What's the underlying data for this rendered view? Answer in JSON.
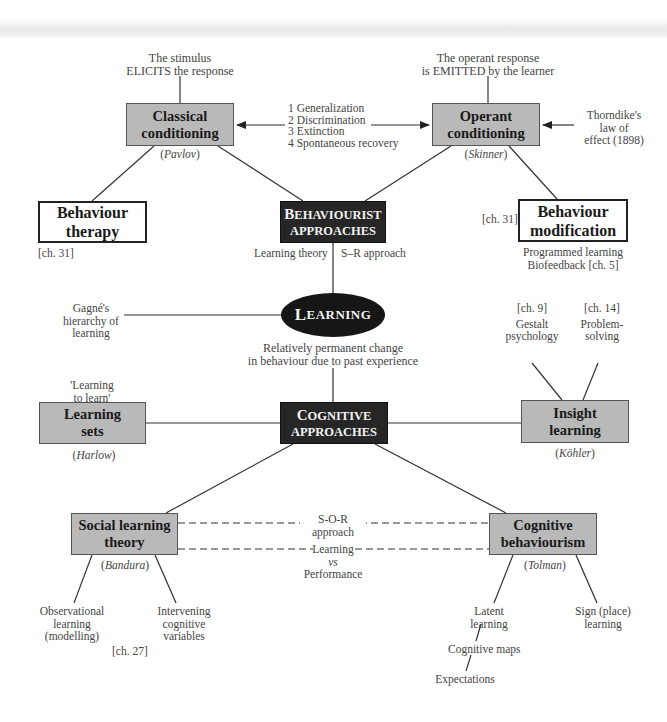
{
  "diagram": {
    "central_node": {
      "label_first": "L",
      "label_rest": "EARNING",
      "full_label": "LEARNING",
      "definition": [
        "Relatively permanent change",
        "in behaviour due to past experience"
      ]
    },
    "behaviourist": {
      "node": {
        "line1_first": "B",
        "line1_rest": "EHAVIOURIST",
        "line2": "APPROACHES"
      },
      "labels": {
        "left": "Learning theory",
        "right": "S–R approach"
      },
      "classical": {
        "title": [
          "Classical",
          "conditioning"
        ],
        "person": "Pavlov",
        "note": [
          "The stimulus",
          "ELICITS the response"
        ]
      },
      "operant": {
        "title": [
          "Operant",
          "conditioning"
        ],
        "person": "Skinner",
        "note": [
          "The operant response",
          "is EMITTED by the learner"
        ],
        "side_note": [
          "Thorndike's",
          "law of",
          "effect (1898)"
        ]
      },
      "shared_processes": [
        "1  Generalization",
        "2  Discrimination",
        "3  Extinction",
        "4  Spontaneous recovery"
      ],
      "behaviour_therapy": {
        "title": [
          "Behaviour",
          "therapy"
        ],
        "ref": "[ch. 31]"
      },
      "behaviour_modification": {
        "title": [
          "Behaviour",
          "modification"
        ],
        "ref": "[ch. 31]",
        "notes": [
          "Programmed learning",
          "Biofeedback [ch. 5]"
        ]
      }
    },
    "gagne": [
      "Gagné's",
      "hierarchy of",
      "learning"
    ],
    "cognitive": {
      "node": {
        "line1_first": "C",
        "line1_rest": "OGNITIVE",
        "line2": "APPROACHES"
      },
      "learning_sets": {
        "title": [
          "Learning",
          "sets"
        ],
        "person": "Harlow",
        "note": [
          "'Learning",
          "to learn'"
        ]
      },
      "insight": {
        "title": [
          "Insight",
          "learning"
        ],
        "person": "Köhler",
        "left_branch": {
          "ref": "[ch. 9]",
          "label": [
            "Gestalt",
            "psychology"
          ]
        },
        "right_branch": {
          "ref": "[ch. 14]",
          "label": [
            "Problem-",
            "solving"
          ]
        }
      },
      "social": {
        "title": [
          "Social learning",
          "theory"
        ],
        "person": "Bandura",
        "branches": [
          [
            "Observational",
            "learning",
            "(modelling)"
          ],
          [
            "Intervening",
            "cognitive",
            "variables"
          ]
        ],
        "ref": "[ch. 27]"
      },
      "cog_behaviourism": {
        "title": [
          "Cognitive",
          "behaviourism"
        ],
        "person": "Tolman",
        "branches": [
          [
            "Latent",
            "learning"
          ],
          [
            "Sign (place)",
            "learning"
          ]
        ],
        "chain": [
          "Cognitive maps",
          "Expectations"
        ]
      },
      "links": {
        "sor": [
          "S-O-R",
          "approach"
        ],
        "lvp": [
          "Learning",
          "vs",
          "Performance"
        ]
      }
    }
  }
}
